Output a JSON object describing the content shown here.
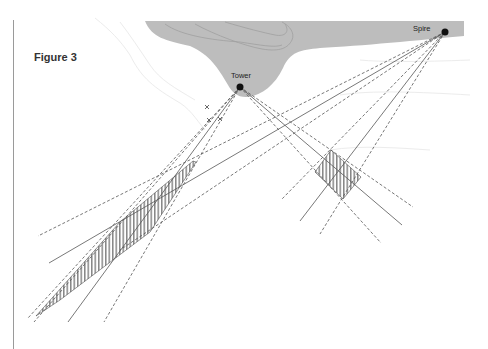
{
  "figure": {
    "title": "Figure 3"
  },
  "landmarks": [
    {
      "name": "Tower",
      "x": 240,
      "y": 87
    },
    {
      "name": "Spire",
      "x": 445,
      "y": 32
    }
  ],
  "colors": {
    "land": "#bdbdbd",
    "contour_land": "#9f9f9f",
    "contour_bg": "#ececec",
    "line": "#555555",
    "point": "#111111"
  },
  "markers": [
    {
      "type": "cross",
      "x": 207,
      "y": 107
    },
    {
      "type": "cross",
      "x": 209,
      "y": 120
    },
    {
      "type": "cross",
      "x": 220,
      "y": 119
    }
  ]
}
